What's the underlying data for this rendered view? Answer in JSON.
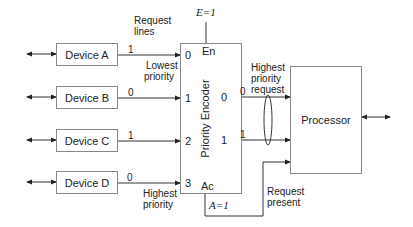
{
  "diagram": {
    "devices": [
      {
        "label": "Device A",
        "request_value": "1",
        "input_index": "0"
      },
      {
        "label": "Device B",
        "request_value": "0",
        "input_index": "1"
      },
      {
        "label": "Device C",
        "request_value": "1",
        "input_index": "2"
      },
      {
        "label": "Device D",
        "request_value": "0",
        "input_index": "3"
      }
    ],
    "annotations": {
      "request_lines": "Request\nlines",
      "request_lines_1": "Request",
      "request_lines_2": "lines",
      "lowest_priority_1": "Lowest",
      "lowest_priority_2": "priority",
      "highest_priority_1": "Highest",
      "highest_priority_2": "priority",
      "highest_priority_request_1": "Highest",
      "highest_priority_request_2": "priority",
      "highest_priority_request_3": "request",
      "request_present_1": "Request",
      "request_present_2": "present"
    },
    "encoder": {
      "label": "Priority Encoder",
      "enable_pin": "En",
      "enable_value": "E=1",
      "active_pin": "Ac",
      "active_value": "A=1",
      "outputs": [
        {
          "pin": "0",
          "value": "0"
        },
        {
          "pin": "1",
          "value": "1"
        }
      ]
    },
    "processor": {
      "label": "Processor"
    },
    "colors": {
      "line": "#333333",
      "box_border": "#888888"
    }
  }
}
